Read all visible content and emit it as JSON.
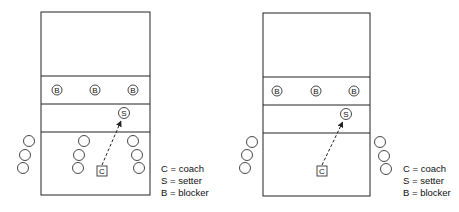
{
  "diagrams": [
    {
      "id": "left",
      "court": {
        "x": 41,
        "y": 12,
        "w": 109,
        "h": 183
      },
      "lines_y": [
        76,
        104,
        132
      ],
      "blockers": [
        {
          "x": 57,
          "y": 90,
          "label": "B"
        },
        {
          "x": 95,
          "y": 90,
          "label": "B"
        },
        {
          "x": 133,
          "y": 90,
          "label": "B"
        }
      ],
      "setter": {
        "x": 124,
        "y": 113,
        "label": "S"
      },
      "waiting_players": [
        {
          "x": 29,
          "y": 141
        },
        {
          "x": 25,
          "y": 155
        },
        {
          "x": 23,
          "y": 168
        },
        {
          "x": 84,
          "y": 141
        },
        {
          "x": 79,
          "y": 155
        },
        {
          "x": 78,
          "y": 168
        },
        {
          "x": 133,
          "y": 141
        },
        {
          "x": 137,
          "y": 155
        },
        {
          "x": 139,
          "y": 168
        }
      ],
      "coach": {
        "x": 102,
        "y": 171,
        "label": "C"
      },
      "legend": {
        "x": 161,
        "y": 169,
        "items": [
          "C = coach",
          "S = setter",
          "B = blocker"
        ]
      }
    },
    {
      "id": "right",
      "court": {
        "x": 263,
        "y": 13,
        "w": 107,
        "h": 183
      },
      "lines_y": [
        77,
        105,
        133
      ],
      "blockers": [
        {
          "x": 277,
          "y": 91,
          "label": "B"
        },
        {
          "x": 316,
          "y": 91,
          "label": "B"
        },
        {
          "x": 354,
          "y": 91,
          "label": "B"
        }
      ],
      "setter": {
        "x": 346,
        "y": 114,
        "label": "S"
      },
      "waiting_players": [
        {
          "x": 252,
          "y": 142
        },
        {
          "x": 247,
          "y": 155
        },
        {
          "x": 245,
          "y": 168
        },
        {
          "x": 380,
          "y": 142
        },
        {
          "x": 384,
          "y": 156
        },
        {
          "x": 386,
          "y": 169
        }
      ],
      "coach": {
        "x": 322,
        "y": 171,
        "label": "C"
      },
      "legend": {
        "x": 403,
        "y": 169,
        "items": [
          "C = coach",
          "S = setter",
          "B = blocker"
        ]
      }
    }
  ]
}
